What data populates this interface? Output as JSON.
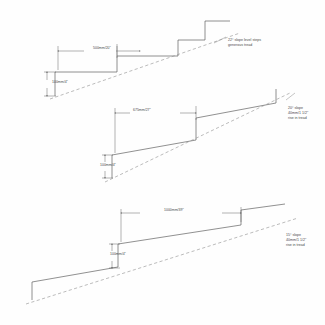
{
  "drawing": {
    "title": "Stepped ramp slope comparison details",
    "units": "mm / inches",
    "line_color": "#555555",
    "dash_color": "#8a8a8a",
    "text_color": "#4a4a4a"
  },
  "details": [
    {
      "id": "detail-top",
      "slope_note_lines": [
        "22° slope level steps",
        "generous tread"
      ],
      "run_dimension": "500mm/20\"",
      "rise_dimension": "100mm/4\""
    },
    {
      "id": "detail-middle",
      "slope_note_lines": [
        "20° slope",
        "40mm/1 1/2\"",
        "rise in tread"
      ],
      "run_dimension": "675mm/27\"",
      "rise_dimension": "100mm/4\""
    },
    {
      "id": "detail-bottom",
      "slope_note_lines": [
        "15° slope",
        "40mm/1 1/2\"",
        "rise in tread"
      ],
      "run_dimension": "1000mm/39\"",
      "rise_dimension": "100mm/4\""
    }
  ]
}
